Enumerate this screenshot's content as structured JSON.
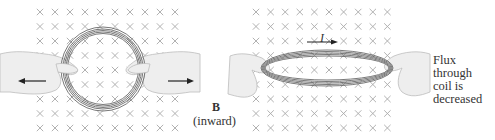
{
  "figure": {
    "left_panel": {
      "description": "Circular coil in inward magnetic field being stretched outward by two hands",
      "field_marker": "×",
      "grid": {
        "cols": 10,
        "rows": 9,
        "x0": 40,
        "dx": 15,
        "y0": 12,
        "dy": 14.5
      }
    },
    "right_panel": {
      "description": "Coil flattened into a narrow ellipse; induced current shown",
      "field_marker": "×",
      "grid": {
        "cols": 10,
        "rows": 9,
        "x0": 256,
        "dx": 14.6,
        "y0": 12,
        "dy": 14.5
      },
      "current_label": "I"
    },
    "labels": {
      "field_symbol": "B",
      "field_direction": "(inward)",
      "flux_note": [
        "Flux",
        "through",
        "coil is",
        "decreased"
      ]
    },
    "colors": {
      "cross": "#a8a8a8",
      "coil": "#6a6a6a",
      "hand_fill": "#eeeeee",
      "hand_stroke": "#bdbdbd",
      "arrow": "#222222",
      "text": "#333333"
    }
  }
}
